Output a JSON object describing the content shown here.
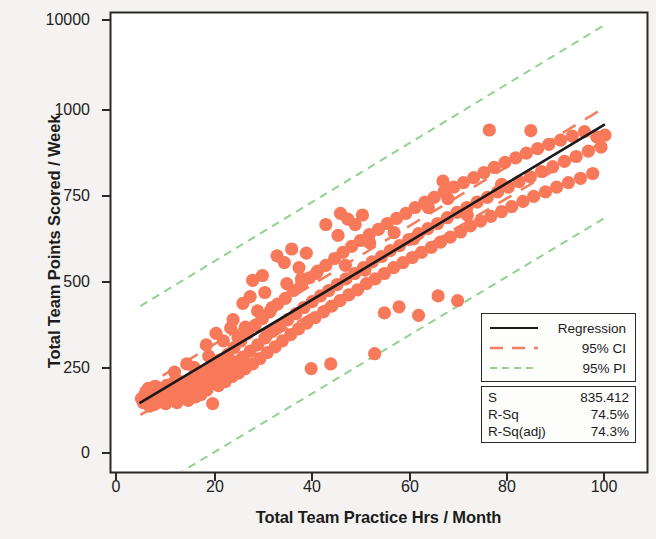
{
  "chart_data": {
    "type": "scatter",
    "title": "",
    "xlabel": "Total Team Practice Hrs / Month",
    "ylabel": "Total Team Points Scored / Week",
    "xlim": [
      0,
      104
    ],
    "ylim_labels": [
      "0",
      "250",
      "500",
      "750",
      "1000",
      "10000"
    ],
    "xticks": [
      0,
      20,
      40,
      60,
      80,
      100
    ],
    "xtick_labels": [
      "0",
      "20",
      "40",
      "60",
      "80",
      "100"
    ],
    "yticks": [
      0,
      250,
      500,
      750,
      1000,
      10000
    ],
    "ytick_labels": [
      "0",
      "250",
      "500",
      "750",
      "1000",
      "10000"
    ],
    "grid": false,
    "legend_position": "lower-right",
    "marker_color": "#f8795a",
    "regression_color": "#1a1a1a",
    "ci_color": "#f08060",
    "pi_color": "#8fd38f",
    "series": [
      {
        "name": "Data",
        "type": "scatter",
        "points": [
          [
            5.2,
            160
          ],
          [
            5.6,
            148
          ],
          [
            6.0,
            175
          ],
          [
            6.3,
            152
          ],
          [
            6.6,
            190
          ],
          [
            6.9,
            138
          ],
          [
            7.1,
            168
          ],
          [
            7.4,
            155
          ],
          [
            7.6,
            182
          ],
          [
            7.9,
            143
          ],
          [
            8.1,
            196
          ],
          [
            8.4,
            162
          ],
          [
            8.7,
            150
          ],
          [
            8.9,
            178
          ],
          [
            9.2,
            166
          ],
          [
            9.4,
            188
          ],
          [
            9.7,
            154
          ],
          [
            9.9,
            172
          ],
          [
            10.2,
            145
          ],
          [
            10.4,
            199
          ],
          [
            10.7,
            163
          ],
          [
            11.0,
            181
          ],
          [
            11.3,
            157
          ],
          [
            11.6,
            205
          ],
          [
            11.9,
            170
          ],
          [
            12.2,
            192
          ],
          [
            12.5,
            148
          ],
          [
            12.8,
            176
          ],
          [
            13.1,
            210
          ],
          [
            13.4,
            160
          ],
          [
            13.7,
            185
          ],
          [
            14.0,
            168
          ],
          [
            14.4,
            200
          ],
          [
            14.8,
            155
          ],
          [
            15.1,
            215
          ],
          [
            15.5,
            178
          ],
          [
            15.9,
            190
          ],
          [
            16.3,
            165
          ],
          [
            16.7,
            225
          ],
          [
            17.0,
            195
          ],
          [
            17.4,
            172
          ],
          [
            17.8,
            235
          ],
          [
            18.2,
            205
          ],
          [
            18.6,
            185
          ],
          [
            19.0,
            250
          ],
          [
            19.4,
            215
          ],
          [
            19.8,
            145
          ],
          [
            20.2,
            265
          ],
          [
            20.6,
            228
          ],
          [
            21.0,
            198
          ],
          [
            21.5,
            275
          ],
          [
            22.0,
            240
          ],
          [
            22.4,
            210
          ],
          [
            22.9,
            290
          ],
          [
            23.3,
            255
          ],
          [
            23.8,
            225
          ],
          [
            24.2,
            310
          ],
          [
            24.7,
            268
          ],
          [
            25.1,
            235
          ],
          [
            25.6,
            330
          ],
          [
            26.0,
            282
          ],
          [
            26.5,
            248
          ],
          [
            27.0,
            352
          ],
          [
            27.5,
            300
          ],
          [
            28.0,
            262
          ],
          [
            28.5,
            375
          ],
          [
            29.0,
            318
          ],
          [
            29.5,
            278
          ],
          [
            30.0,
            395
          ],
          [
            30.5,
            338
          ],
          [
            31.0,
            295
          ],
          [
            31.5,
            415
          ],
          [
            32.0,
            358
          ],
          [
            32.6,
            312
          ],
          [
            33.1,
            438
          ],
          [
            33.6,
            375
          ],
          [
            34.1,
            330
          ],
          [
            34.7,
            455
          ],
          [
            35.2,
            392
          ],
          [
            35.8,
            348
          ],
          [
            36.3,
            478
          ],
          [
            36.9,
            410
          ],
          [
            37.4,
            365
          ],
          [
            38.0,
            495
          ],
          [
            38.5,
            428
          ],
          [
            39.1,
            382
          ],
          [
            39.6,
            515
          ],
          [
            40.2,
            445
          ],
          [
            40.8,
            398
          ],
          [
            41.3,
            535
          ],
          [
            41.9,
            462
          ],
          [
            42.5,
            415
          ],
          [
            43.0,
            552
          ],
          [
            43.6,
            478
          ],
          [
            44.2,
            432
          ],
          [
            44.8,
            572
          ],
          [
            45.3,
            495
          ],
          [
            45.9,
            448
          ],
          [
            46.5,
            590
          ],
          [
            47.1,
            512
          ],
          [
            47.7,
            465
          ],
          [
            48.3,
            608
          ],
          [
            48.9,
            528
          ],
          [
            49.5,
            480
          ],
          [
            50.1,
            625
          ],
          [
            50.7,
            545
          ],
          [
            51.3,
            498
          ],
          [
            51.9,
            642
          ],
          [
            52.5,
            562
          ],
          [
            53.1,
            512
          ],
          [
            53.8,
            658
          ],
          [
            54.4,
            578
          ],
          [
            55.0,
            528
          ],
          [
            55.6,
            675
          ],
          [
            56.2,
            595
          ],
          [
            56.9,
            545
          ],
          [
            57.5,
            690
          ],
          [
            58.1,
            610
          ],
          [
            58.8,
            560
          ],
          [
            59.4,
            705
          ],
          [
            60.0,
            628
          ],
          [
            60.7,
            575
          ],
          [
            61.3,
            722
          ],
          [
            62.0,
            645
          ],
          [
            62.6,
            590
          ],
          [
            63.3,
            738
          ],
          [
            63.9,
            660
          ],
          [
            64.6,
            605
          ],
          [
            65.2,
            752
          ],
          [
            65.9,
            675
          ],
          [
            66.5,
            620
          ],
          [
            67.2,
            768
          ],
          [
            67.9,
            692
          ],
          [
            68.5,
            635
          ],
          [
            69.2,
            782
          ],
          [
            69.9,
            708
          ],
          [
            70.6,
            650
          ],
          [
            71.2,
            795
          ],
          [
            71.9,
            722
          ],
          [
            72.6,
            668
          ],
          [
            73.3,
            810
          ],
          [
            74.0,
            738
          ],
          [
            74.7,
            682
          ],
          [
            75.4,
            825
          ],
          [
            76.1,
            752
          ],
          [
            76.8,
            696
          ],
          [
            77.5,
            840
          ],
          [
            78.2,
            768
          ],
          [
            79.0,
            710
          ],
          [
            79.7,
            855
          ],
          [
            80.4,
            782
          ],
          [
            81.1,
            725
          ],
          [
            81.9,
            868
          ],
          [
            82.6,
            798
          ],
          [
            83.4,
            740
          ],
          [
            84.1,
            882
          ],
          [
            84.9,
            812
          ],
          [
            85.6,
            755
          ],
          [
            86.4,
            895
          ],
          [
            87.2,
            828
          ],
          [
            88.0,
            768
          ],
          [
            88.7,
            908
          ],
          [
            89.5,
            842
          ],
          [
            90.3,
            782
          ],
          [
            91.1,
            920
          ],
          [
            91.9,
            858
          ],
          [
            92.7,
            795
          ],
          [
            93.5,
            932
          ],
          [
            94.3,
            872
          ],
          [
            95.2,
            808
          ],
          [
            96.0,
            945
          ],
          [
            96.8,
            888
          ],
          [
            97.7,
            822
          ],
          [
            98.5,
            930
          ],
          [
            99.4,
            900
          ],
          [
            100.2,
            935
          ],
          [
            46.0,
            705
          ],
          [
            47.5,
            688
          ],
          [
            49.0,
            672
          ],
          [
            50.5,
            700
          ],
          [
            33.0,
            580
          ],
          [
            34.5,
            560
          ],
          [
            36.0,
            600
          ],
          [
            37.5,
            545
          ],
          [
            39.0,
            588
          ],
          [
            26.0,
            440
          ],
          [
            27.5,
            460
          ],
          [
            29.0,
            418
          ],
          [
            30.5,
            472
          ],
          [
            32.0,
            428
          ],
          [
            20.5,
            352
          ],
          [
            22.0,
            330
          ],
          [
            23.5,
            368
          ],
          [
            25.0,
            340
          ],
          [
            18.5,
            318
          ],
          [
            55.0,
            412
          ],
          [
            58.0,
            430
          ],
          [
            62.0,
            405
          ],
          [
            66.0,
            462
          ],
          [
            70.0,
            448
          ],
          [
            76.5,
            950
          ],
          [
            85.0,
            948
          ],
          [
            44.0,
            262
          ],
          [
            53.0,
            292
          ],
          [
            40.0,
            248
          ],
          [
            43.0,
            672
          ],
          [
            45.5,
            640
          ],
          [
            52.0,
            618
          ],
          [
            57.0,
            648
          ],
          [
            61.0,
            630
          ],
          [
            12.0,
            238
          ],
          [
            14.5,
            262
          ],
          [
            16.0,
            252
          ],
          [
            19.0,
            285
          ],
          [
            21.0,
            272
          ],
          [
            35.0,
            498
          ],
          [
            38.0,
            512
          ],
          [
            41.0,
            528
          ],
          [
            47.0,
            552
          ],
          [
            51.0,
            538
          ],
          [
            64.0,
            722
          ],
          [
            68.0,
            748
          ],
          [
            72.0,
            700
          ],
          [
            79.0,
            790
          ],
          [
            67.0,
            800
          ],
          [
            28.0,
            508
          ],
          [
            30.0,
            522
          ],
          [
            24.0,
            392
          ],
          [
            26.5,
            370
          ],
          [
            31.0,
            348
          ]
        ]
      },
      {
        "name": "Regression",
        "type": "line",
        "style": "solid",
        "color": "#1a1a1a",
        "x": [
          5,
          100
        ],
        "y": [
          148,
          965
        ]
      },
      {
        "name": "95% CI",
        "type": "line",
        "style": "dashed",
        "color": "#f08060",
        "upper_x": [
          5,
          100
        ],
        "upper_y": [
          188,
          1015
        ],
        "lower_x": [
          5,
          100
        ],
        "lower_y": [
          112,
          918
        ]
      },
      {
        "name": "95% PI",
        "type": "line",
        "style": "dashed",
        "color": "#8fd38f",
        "upper_x": [
          5,
          100
        ],
        "upper_y": [
          432,
          1258
        ],
        "lower_x": [
          5,
          100
        ],
        "lower_y": [
          -128,
          690
        ]
      }
    ]
  },
  "legend": {
    "items": [
      {
        "label": "Regression",
        "style": "solid",
        "color": "#1a1a1a"
      },
      {
        "label": "95% CI",
        "style": "dashed",
        "color": "#f08060"
      },
      {
        "label": "95% PI",
        "style": "dashed",
        "color": "#8fd38f"
      }
    ]
  },
  "stats": {
    "rows": [
      {
        "key": "S",
        "value": "835.412"
      },
      {
        "key": "R-Sq",
        "value": "74.5%"
      },
      {
        "key": "R-Sq(adj)",
        "value": "74.3%"
      }
    ]
  },
  "axes": {
    "y_title": "Total Team Points Scored / Week",
    "x_title": "Total Team Practice Hrs / Month",
    "y_tick_labels": [
      "10000",
      "1000",
      "750",
      "500",
      "250",
      "0"
    ],
    "x_tick_labels": [
      "0",
      "20",
      "40",
      "60",
      "80",
      "100"
    ]
  }
}
